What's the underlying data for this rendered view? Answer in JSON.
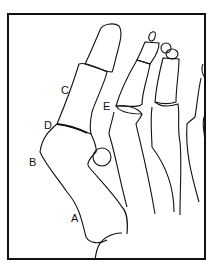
{
  "figure": {
    "type": "anatomical line drawing of forefoot bones (dorsal view)",
    "labels": [
      {
        "id": "A",
        "text": "A"
      },
      {
        "id": "B",
        "text": "B"
      },
      {
        "id": "C",
        "text": "C"
      },
      {
        "id": "D",
        "text": "D"
      },
      {
        "id": "E",
        "text": "E"
      }
    ]
  }
}
